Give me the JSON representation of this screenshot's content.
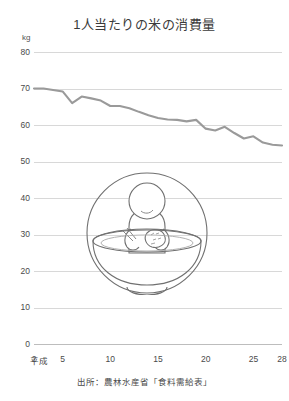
{
  "title": "1人当たりの米の消費量",
  "unit": "kg",
  "source": "出所：農林水産省「食料需給表」",
  "era_label": "平成",
  "colors": {
    "line": "#9a9a9a",
    "grid": "#d8d8d8",
    "text": "#3b3b3b",
    "illustration_stroke": "#6e6e6e",
    "background": "#ffffff"
  },
  "illustration": {
    "name": "person-in-rice-bowl",
    "description": "円の中に大きな茶碗に入った人物が箸とおにぎりを持つイラスト",
    "parts": [
      "circle-frame",
      "rice-bowl",
      "person",
      "chopsticks",
      "rice-ball"
    ]
  },
  "chart_data": {
    "type": "line",
    "title": "1人当たりの米の消費量",
    "xlabel": "平成",
    "ylabel": "kg",
    "ylim": [
      0,
      80
    ],
    "ytick_values": [
      0,
      10,
      20,
      30,
      40,
      50,
      60,
      70,
      80
    ],
    "ytick_labels": [
      "0",
      "10",
      "20",
      "30",
      "40",
      "50",
      "60",
      "70",
      "80"
    ],
    "xlim": [
      2,
      28
    ],
    "xtick_values": [
      2,
      5,
      10,
      15,
      20,
      25,
      28
    ],
    "xtick_labels": [
      "2",
      "5",
      "10",
      "15",
      "20",
      "25",
      "28"
    ],
    "grid": true,
    "legend": false,
    "series": [
      {
        "name": "1人当たりの米の消費量",
        "color": "#9a9a9a",
        "x": [
          2,
          3,
          4,
          5,
          6,
          7,
          8,
          9,
          10,
          11,
          12,
          13,
          14,
          15,
          16,
          17,
          18,
          19,
          20,
          21,
          22,
          23,
          24,
          25,
          26,
          27,
          28
        ],
        "values": [
          70.0,
          70.0,
          69.6,
          69.2,
          66.0,
          67.8,
          67.3,
          66.7,
          65.2,
          65.2,
          64.6,
          63.6,
          62.7,
          61.9,
          61.5,
          61.4,
          61.0,
          61.4,
          59.0,
          58.5,
          59.5,
          57.8,
          56.3,
          56.9,
          55.2,
          54.6,
          54.4
        ]
      }
    ]
  }
}
